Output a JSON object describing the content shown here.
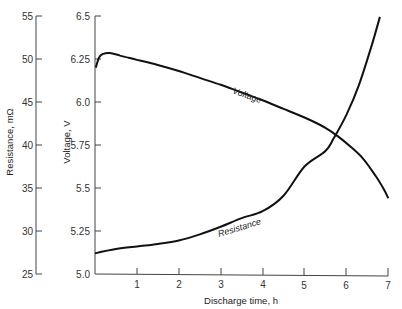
{
  "chart_data": {
    "type": "line",
    "title": "",
    "xlabel": "Discharge time, h",
    "ylabel_left": "Resistance, mΩ",
    "ylabel_right": "Voltage, V",
    "xlim": [
      0,
      7
    ],
    "ylim_voltage": [
      5.0,
      6.5
    ],
    "ylim_resistance": [
      25,
      55
    ],
    "x_ticks": [
      "1",
      "2",
      "3",
      "4",
      "5",
      "6",
      "7"
    ],
    "voltage_ticks": [
      "5.0",
      "5.25",
      "5.5",
      "5.75",
      "6.0",
      "6.25",
      "6.5"
    ],
    "resistance_ticks": [
      "25",
      "30",
      "35",
      "40",
      "45",
      "50",
      "55"
    ],
    "grid": false,
    "legend": "inline curve labels",
    "series": [
      {
        "name": "Voltage",
        "axis": "voltage",
        "x": [
          0.02,
          0.1,
          0.2,
          0.35,
          0.6,
          1.0,
          1.5,
          2.0,
          2.5,
          3.0,
          3.5,
          4.0,
          4.5,
          5.0,
          5.5,
          5.8,
          6.1,
          6.4,
          6.7,
          6.9,
          7.0
        ],
        "values": [
          6.2,
          6.26,
          6.28,
          6.285,
          6.27,
          6.245,
          6.215,
          6.18,
          6.14,
          6.1,
          6.055,
          6.01,
          5.96,
          5.91,
          5.85,
          5.8,
          5.74,
          5.67,
          5.57,
          5.49,
          5.44
        ]
      },
      {
        "name": "Resistance",
        "axis": "resistance",
        "x": [
          0.0,
          0.5,
          1.0,
          1.5,
          2.0,
          2.5,
          3.0,
          3.5,
          4.0,
          4.5,
          5.0,
          5.5,
          5.7,
          6.0,
          6.3,
          6.6,
          6.8
        ],
        "values": [
          27.4,
          27.9,
          28.2,
          28.5,
          28.9,
          29.6,
          30.5,
          31.5,
          32.3,
          34.1,
          37.5,
          39.3,
          40.8,
          43.5,
          47.0,
          51.5,
          54.9
        ]
      }
    ],
    "annotations": [
      {
        "text": "Voltage",
        "x": 4.2,
        "y": 6.14,
        "axis": "voltage"
      },
      {
        "text": "Resistance",
        "x": 2.9,
        "y": 31.0,
        "axis": "resistance"
      }
    ]
  },
  "labels": {
    "xlabel": "Discharge time, h",
    "ylabel_left": "Resistance, mΩ",
    "ylabel_right": "Voltage, V",
    "voltage_curve": "Voltage",
    "resistance_curve": "Resistance"
  }
}
